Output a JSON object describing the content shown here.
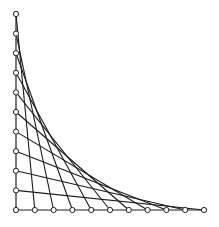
{
  "diagram": {
    "type": "string-art-envelope-curve",
    "origin": [
      16,
      210
    ],
    "vertical_axis": {
      "x": 16,
      "y_top": 14,
      "y_bottom": 210,
      "points": 11
    },
    "horizontal_axis": {
      "y": 210,
      "x_left": 16,
      "x_right": 204,
      "points": 11
    },
    "peg_radius": 2.6,
    "colors": {
      "line": "#1a1a1a",
      "peg_fill": "#ffffff",
      "peg_stroke": "#222222",
      "background": "#ffffff"
    },
    "rule": "vertical point i (from top) connects to horizontal point i+1 (from origin)"
  }
}
